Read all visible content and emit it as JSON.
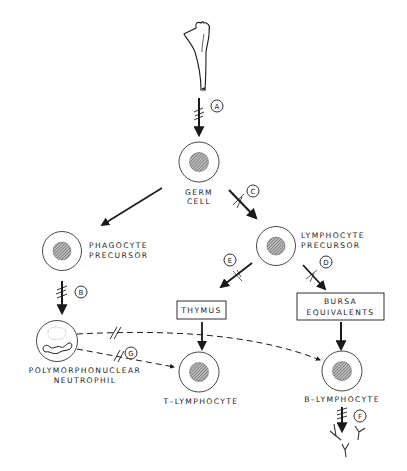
{
  "diagram": {
    "type": "flow-diagram",
    "colors": {
      "ink": "#1a1a1a",
      "background": "#ffffff",
      "nucleus": "#888888"
    },
    "nodes": {
      "bone": {
        "label": "",
        "icon": "femur-bone-icon"
      },
      "germ_cell": {
        "line1": "GERM",
        "line2": "CELL"
      },
      "phagocyte_precursor": {
        "line1": "PHAGOCYTE",
        "line2": "PRECURSOR"
      },
      "lymphocyte_precursor": {
        "line1": "LYMPHOCYTE",
        "line2": "PRECURSOR"
      },
      "thymus": {
        "label": "THYMUS"
      },
      "bursa": {
        "line1": "BURSA",
        "line2": "EQUIVALENTS"
      },
      "neutrophil": {
        "line1": "POLYMORPHONUCLEAR",
        "line2": "NEUTROPHIL"
      },
      "t_lymphocyte": {
        "label": "T–LYMPHOCYTE"
      },
      "b_lymphocyte": {
        "label": "B–LYMPHOCYTE"
      },
      "antibodies": {
        "label": "",
        "icon": "antibody-icon"
      }
    },
    "markers": {
      "A": "A",
      "B": "B",
      "C": "C",
      "D": "D",
      "E": "E",
      "F": "F",
      "G": "G"
    },
    "edges": [
      {
        "from": "bone",
        "to": "germ_cell",
        "marker": "A",
        "style": "solid"
      },
      {
        "from": "germ_cell",
        "to": "phagocyte_precursor",
        "marker": "",
        "style": "solid"
      },
      {
        "from": "germ_cell",
        "to": "lymphocyte_precursor",
        "marker": "C",
        "style": "solid"
      },
      {
        "from": "phagocyte_precursor",
        "to": "neutrophil",
        "marker": "B",
        "style": "solid"
      },
      {
        "from": "lymphocyte_precursor",
        "to": "thymus",
        "marker": "E",
        "style": "solid"
      },
      {
        "from": "lymphocyte_precursor",
        "to": "bursa",
        "marker": "D",
        "style": "solid"
      },
      {
        "from": "thymus",
        "to": "t_lymphocyte",
        "marker": "",
        "style": "solid"
      },
      {
        "from": "bursa",
        "to": "b_lymphocyte",
        "marker": "",
        "style": "solid"
      },
      {
        "from": "neutrophil",
        "to": "t_lymphocyte",
        "marker": "G",
        "style": "dashed"
      },
      {
        "from": "neutrophil",
        "to": "b_lymphocyte",
        "marker": "",
        "style": "dashed"
      },
      {
        "from": "b_lymphocyte",
        "to": "antibodies",
        "marker": "F",
        "style": "solid"
      }
    ]
  }
}
